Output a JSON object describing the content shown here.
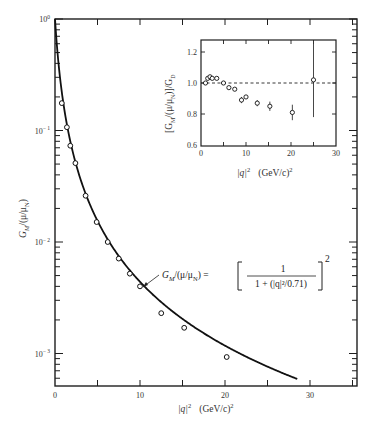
{
  "chart_data": [
    {
      "type": "scatter",
      "title": "",
      "xlabel": "|q|^2  (GeV/c)^2",
      "ylabel": "G_M/(μ/μ_N)",
      "yscale": "log",
      "xlim": [
        0,
        35.5
      ],
      "ylim": [
        0.0005,
        1
      ],
      "xticks": [
        0,
        10,
        20,
        30
      ],
      "xtick_labels": [
        "0",
        "10",
        "20",
        "30"
      ],
      "yticks": [
        1,
        0.1,
        0.01,
        0.001
      ],
      "ytick_labels": [
        "10^0",
        "10^-1",
        "10^-2",
        "10^-3"
      ],
      "grid": false,
      "series": [
        {
          "name": "data",
          "marker": "open-circle",
          "x": [
            0.8,
            1.4,
            1.8,
            2.4,
            3.6,
            4.9,
            6.2,
            7.5,
            8.8,
            10.0,
            12.5,
            15.2,
            20.2
          ],
          "y": [
            0.176,
            0.107,
            0.073,
            0.051,
            0.026,
            0.0151,
            0.01,
            0.0071,
            0.0052,
            0.004,
            0.0023,
            0.0017,
            0.00093
          ]
        },
        {
          "name": "dipole fit",
          "type": "line",
          "formula": "G_M/(μ/μ_N) = [1 / (1 + (|q|^2/0.71))]^2",
          "x_range": [
            0,
            28.5
          ]
        }
      ],
      "annotations": [
        {
          "text_lhs": "G_M/(μ/μ_N) =",
          "numerator": "1",
          "denominator": "1 + (|q|²/0.71)",
          "exponent": "2"
        }
      ]
    },
    {
      "type": "scatter",
      "title": "inset",
      "xlabel": "|q|^2  (GeV/c)^2",
      "ylabel": "[G_M/(μ/μ_N)]/G_D",
      "xlim": [
        0,
        30
      ],
      "ylim": [
        0.6,
        1.3
      ],
      "xticks": [
        0,
        10,
        20,
        30
      ],
      "xtick_labels": [
        "0",
        "10",
        "20",
        "30"
      ],
      "yticks": [
        0.6,
        0.8,
        1.0,
        1.2
      ],
      "ytick_labels": [
        "0.6",
        "0.8",
        "1.0",
        "1.2"
      ],
      "reference_line": {
        "y": 1.0,
        "style": "dashed"
      },
      "series": [
        {
          "name": "ratio",
          "marker": "open-circle",
          "x": [
            1.0,
            1.5,
            2.0,
            2.5,
            3.5,
            5.0,
            6.2,
            7.5,
            9.0,
            10.0,
            12.5,
            15.3,
            20.3,
            25.0
          ],
          "y": [
            1.0,
            1.03,
            1.04,
            1.03,
            1.03,
            1.0,
            0.97,
            0.96,
            0.89,
            0.91,
            0.87,
            0.85,
            0.81,
            1.02
          ],
          "err": [
            0,
            0,
            0,
            0,
            0,
            0,
            0,
            0,
            0.02,
            0,
            0.02,
            0.03,
            0.05,
            0.24
          ]
        }
      ]
    }
  ],
  "labels": {
    "main_xlabel_q": "|q|",
    "main_xlabel_sup": "2",
    "main_xlabel_units": "(GeV/c)",
    "main_ylabel": "G",
    "main_ylabel_sub": "M",
    "main_ylabel_rest": "/(μ/μ",
    "main_ylabel_sub2": "N",
    "main_ylabel_end": ")",
    "inset_ylabel_a": "[G",
    "inset_ylabel_sub": "M",
    "inset_ylabel_b": "/(μ/μ",
    "inset_ylabel_sub2": "N",
    "inset_ylabel_c": ")]/G",
    "inset_ylabel_sub3": "D",
    "formula_lhs_a": "G",
    "formula_lhs_sub": "M",
    "formula_lhs_b": "/(μ/μ",
    "formula_lhs_sub2": "N",
    "formula_lhs_c": ") =",
    "formula_num": "1",
    "formula_den": "1 + (|q|²/0.71)",
    "formula_exp": "2"
  }
}
